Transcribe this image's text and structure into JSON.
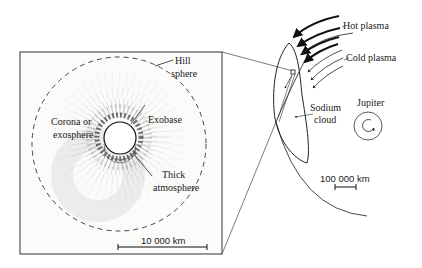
{
  "figure": {
    "inset": {
      "labels": {
        "hill_1": "Hill",
        "hill_2": "sphere",
        "corona_1": "Corona or",
        "corona_2": "exosphere",
        "exobase": "Exobase",
        "thick_1": "Thick",
        "thick_2": "atmosphere"
      },
      "scale_bar": "10 000 km"
    },
    "overview": {
      "labels": {
        "hot_plasma": "Hot plasma",
        "cold_plasma": "Cold plasma",
        "sodium_1": "Sodium",
        "sodium_2": "cloud",
        "jupiter": "Jupiter"
      },
      "scale_bar": "100 000 km"
    }
  }
}
